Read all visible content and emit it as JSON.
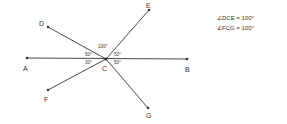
{
  "points": {
    "A": "A",
    "B": "B",
    "C": "C",
    "D": "D",
    "E": "E",
    "F": "F",
    "G": "G"
  },
  "angles": {
    "top": "100°",
    "upper_left": "50°",
    "upper_right": "50°",
    "lower_left": "30°",
    "lower_right": "50°"
  },
  "equations": [
    "∠DCE = 100°",
    "∠FCG = 100°"
  ],
  "colors": {
    "line": "#333333",
    "text": "#333333"
  }
}
